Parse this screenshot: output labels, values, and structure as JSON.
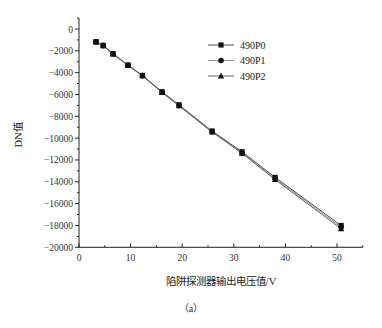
{
  "chart_data": {
    "type": "line",
    "title": "",
    "xlabel": "陷阱探测器输出电压值/V",
    "ylabel": "DN值",
    "xlim": [
      0,
      55
    ],
    "ylim": [
      -20000,
      1000
    ],
    "x_ticks": [
      0,
      10,
      20,
      30,
      40,
      50
    ],
    "y_ticks": [
      0,
      -2000,
      -4000,
      -6000,
      -8000,
      -10000,
      -12000,
      -14000,
      -16000,
      -18000,
      -20000
    ],
    "grid": false,
    "legend_position": "upper right",
    "x": [
      3.3,
      4.7,
      6.6,
      9.5,
      12.3,
      16.1,
      19.4,
      25.8,
      31.6,
      38.0,
      50.8
    ],
    "series": [
      {
        "name": "490P0",
        "marker": "square",
        "values": [
          -1150,
          -1500,
          -2250,
          -3300,
          -4250,
          -5750,
          -6950,
          -9350,
          -11250,
          -13600,
          -18000
        ]
      },
      {
        "name": "490P1",
        "marker": "circle",
        "values": [
          -1180,
          -1520,
          -2280,
          -3320,
          -4280,
          -5800,
          -7000,
          -9400,
          -11350,
          -13700,
          -18150
        ]
      },
      {
        "name": "490P2",
        "marker": "triangle",
        "values": [
          -1200,
          -1550,
          -2300,
          -3350,
          -4300,
          -5830,
          -7050,
          -9450,
          -11400,
          -13800,
          -18300
        ]
      }
    ]
  },
  "labels": {
    "xlabel": "陷阱探测器输出电压值/V",
    "ylabel": "DN值",
    "caption": "（a）"
  }
}
